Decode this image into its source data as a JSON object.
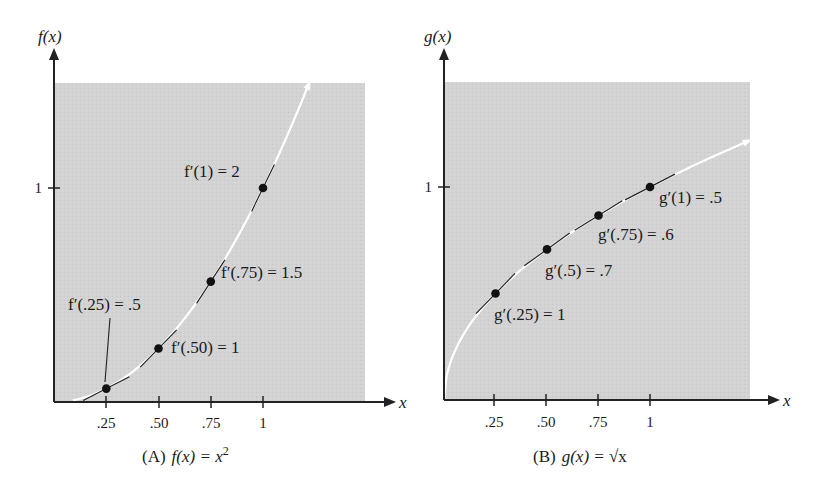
{
  "chart_data": [
    {
      "type": "line",
      "title": "(A) f(x) = x²",
      "caption_prefix": "(A)",
      "caption_func": "f(x) = x",
      "caption_sup": "2",
      "xlabel": "x",
      "ylabel": "f(x)",
      "x_ticks": [
        ".25",
        ".50",
        ".75",
        "1"
      ],
      "y_ticks": [
        "1"
      ],
      "xlim": [
        0,
        1.3
      ],
      "ylim": [
        0,
        1.5
      ],
      "grid": false,
      "background": "#d4d4d4",
      "curve_color": "#ffffff",
      "function": "x^2",
      "points": [
        {
          "x": 0.25,
          "y": 0.0625,
          "label": "f′(.25) = .5",
          "slope": 0.5
        },
        {
          "x": 0.5,
          "y": 0.25,
          "label": "f′(.50) = 1",
          "slope": 1
        },
        {
          "x": 0.75,
          "y": 0.5625,
          "label": "f′(.75) = 1.5",
          "slope": 1.5
        },
        {
          "x": 1,
          "y": 1,
          "label": "f′(1) = 2",
          "slope": 2
        }
      ]
    },
    {
      "type": "line",
      "title": "(B) g(x) = √x",
      "caption_prefix": "(B)",
      "caption_func": "g(x) = ",
      "caption_sqrt": "√x",
      "xlabel": "x",
      "ylabel": "g(x)",
      "x_ticks": [
        ".25",
        ".50",
        ".75",
        "1"
      ],
      "y_ticks": [
        "1"
      ],
      "xlim": [
        0,
        1.5
      ],
      "ylim": [
        0,
        1.5
      ],
      "grid": false,
      "background": "#d4d4d4",
      "curve_color": "#ffffff",
      "function": "sqrt(x)",
      "points": [
        {
          "x": 0.25,
          "y": 0.5,
          "label": "g′(.25) = 1",
          "slope": 1
        },
        {
          "x": 0.5,
          "y": 0.707,
          "label": "g′(.5) = .7",
          "slope": 0.7
        },
        {
          "x": 0.75,
          "y": 0.866,
          "label": "g′(.75) = .6",
          "slope": 0.6
        },
        {
          "x": 1,
          "y": 1,
          "label": "g′(1) = .5",
          "slope": 0.5
        }
      ]
    }
  ]
}
